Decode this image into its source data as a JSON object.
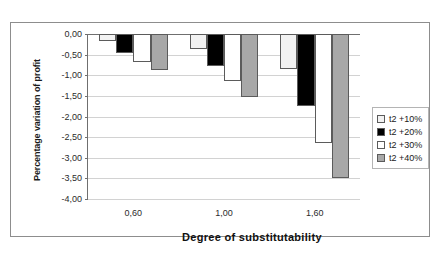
{
  "chart_data": {
    "type": "bar",
    "title": "",
    "xlabel": "Degree of substitutability",
    "ylabel": "Percentage variation of profit",
    "categories": [
      "0,60",
      "1,00",
      "1,60"
    ],
    "series": [
      {
        "name": "t2 +10%",
        "color": "#f2f2f2",
        "values": [
          -0.17,
          -0.37,
          -0.85
        ]
      },
      {
        "name": "t2 +20%",
        "color": "#000000",
        "values": [
          -0.47,
          -0.77,
          -1.75
        ]
      },
      {
        "name": "t2 +30%",
        "color": "#ffffff",
        "values": [
          -0.67,
          -1.15,
          -2.65
        ]
      },
      {
        "name": "t2 +40%",
        "color": "#a8a8a8",
        "values": [
          -0.87,
          -1.53,
          -3.5
        ]
      }
    ],
    "ylim": [
      -4.0,
      0.0
    ],
    "ytick_labels": [
      "0,00",
      "-0,50",
      "-1,00",
      "-1,50",
      "-2,00",
      "-2,50",
      "-3,00",
      "-3,50",
      "-4,00"
    ],
    "ytick_values": [
      0.0,
      -0.5,
      -1.0,
      -1.5,
      -2.0,
      -2.5,
      -3.0,
      -3.5,
      -4.0
    ],
    "grid": true,
    "legend_position": "right",
    "gridline_color": "#d2d2d2",
    "axis_color": "#6f6f6f",
    "bar_border_color": "#5b5b5b",
    "frame_color": "#8d8d8d"
  }
}
